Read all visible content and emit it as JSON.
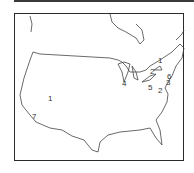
{
  "map": {
    "region": "Contiguous United States",
    "labels": [
      {
        "text": "1",
        "x": 48,
        "y": 95
      },
      {
        "text": "7",
        "x": 32,
        "y": 113
      },
      {
        "text": "4",
        "x": 122,
        "y": 80
      },
      {
        "text": "2",
        "x": 150,
        "y": 68
      },
      {
        "text": "1",
        "x": 158,
        "y": 57
      },
      {
        "text": "5",
        "x": 148,
        "y": 84
      },
      {
        "text": "6",
        "x": 167,
        "y": 73
      },
      {
        "text": "3",
        "x": 166,
        "y": 79
      },
      {
        "text": "2",
        "x": 158,
        "y": 87
      }
    ]
  }
}
